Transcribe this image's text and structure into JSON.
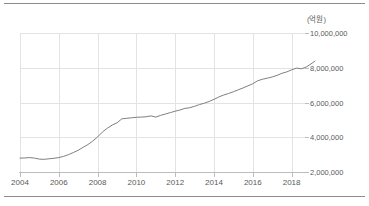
{
  "figure": {
    "background_color": "#ffffff",
    "rule_color": "#8c8c8c",
    "unit_label": "(억원)"
  },
  "chart_data": {
    "type": "line",
    "title": "",
    "subtitle": "",
    "xlabel": "",
    "ylabel": "(억원)",
    "unit": "억원",
    "grid": true,
    "legend": false,
    "legend_position": "none",
    "y_axis_position": "right",
    "line_color": "#7f7f7f",
    "grid_color": "#e3e3e3",
    "axis_color": "#bdbdbd",
    "xlim": [
      2004.0,
      2019.2
    ],
    "ylim": [
      2000000,
      10000000
    ],
    "x_ticks": [
      2004,
      2006,
      2008,
      2010,
      2012,
      2014,
      2016,
      2018
    ],
    "x_tick_labels": [
      "2004",
      "2006",
      "2008",
      "2010",
      "2012",
      "2014",
      "2016",
      "2018"
    ],
    "y_ticks": [
      2000000,
      4000000,
      6000000,
      8000000,
      10000000
    ],
    "y_tick_labels": [
      "2,000,000",
      "4,000,000",
      "6,000,000",
      "8,000,000",
      "10,000,000"
    ],
    "series": [
      {
        "name": "금액",
        "color": "#7f7f7f",
        "x": [
          2004.0,
          2004.25,
          2004.5,
          2004.75,
          2005.0,
          2005.25,
          2005.5,
          2005.75,
          2006.0,
          2006.25,
          2006.5,
          2006.75,
          2007.0,
          2007.25,
          2007.5,
          2007.75,
          2008.0,
          2008.25,
          2008.5,
          2008.75,
          2009.0,
          2009.25,
          2009.5,
          2009.75,
          2010.0,
          2010.25,
          2010.5,
          2010.75,
          2011.0,
          2011.25,
          2011.5,
          2011.75,
          2012.0,
          2012.25,
          2012.5,
          2012.75,
          2013.0,
          2013.25,
          2013.5,
          2013.75,
          2014.0,
          2014.25,
          2014.5,
          2014.75,
          2015.0,
          2015.25,
          2015.5,
          2015.75,
          2016.0,
          2016.25,
          2016.5,
          2016.75,
          2017.0,
          2017.25,
          2017.5,
          2017.75,
          2018.0,
          2018.25,
          2018.5,
          2018.75,
          2019.0,
          2019.2
        ],
        "y": [
          2800000,
          2810000,
          2830000,
          2800000,
          2740000,
          2730000,
          2760000,
          2790000,
          2830000,
          2900000,
          3000000,
          3120000,
          3250000,
          3420000,
          3580000,
          3780000,
          4020000,
          4300000,
          4520000,
          4700000,
          4830000,
          5060000,
          5090000,
          5120000,
          5150000,
          5160000,
          5180000,
          5230000,
          5160000,
          5260000,
          5340000,
          5420000,
          5500000,
          5570000,
          5660000,
          5700000,
          5780000,
          5880000,
          5960000,
          6060000,
          6180000,
          6320000,
          6430000,
          6520000,
          6620000,
          6730000,
          6840000,
          6960000,
          7080000,
          7250000,
          7340000,
          7400000,
          7470000,
          7560000,
          7680000,
          7760000,
          7880000,
          7980000,
          7940000,
          8040000,
          8220000,
          8380000
        ]
      }
    ]
  }
}
